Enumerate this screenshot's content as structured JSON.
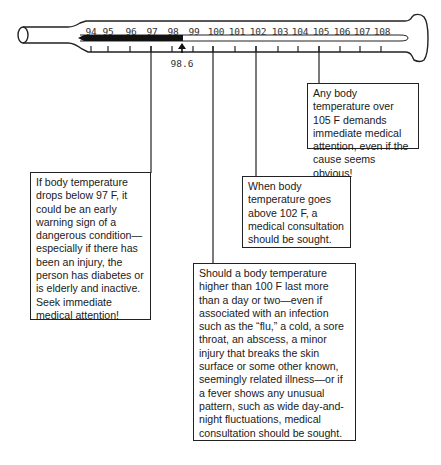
{
  "thermometer": {
    "unit": "F",
    "scale_labels": [
      "94",
      "95",
      "96",
      "97",
      "98",
      "99",
      "100",
      "101",
      "102",
      "103",
      "104",
      "105",
      "106",
      "107",
      "108"
    ],
    "normal_marker": {
      "value": 98.6,
      "label": "98.6"
    }
  },
  "notes": [
    {
      "id": "below-97",
      "threshold": "97",
      "text": "If body temperature drops below 97 F, it could be an early warning sign of a dangerous condition—especially if there has been an injury, the person has diabetes or is elderly and inactive. Seek immediate medical attention!"
    },
    {
      "id": "above-100",
      "threshold": "100",
      "text": "Should a body temperature higher than 100 F last more than a day or two—even if associated with an infection such as the “flu,” a cold, a sore throat, an abscess, a minor injury that breaks the skin surface or some other known, seemingly related illness—or if a fever shows any unusual pattern, such as wide day-and-night fluctuations, medical consultation should be sought."
    },
    {
      "id": "above-102",
      "threshold": "102",
      "text": "When body temperature goes above 102 F, a medical consultation should be sought."
    },
    {
      "id": "over-105",
      "threshold": "105",
      "text": "Any body temperature over 105 F demands immediate medical attention, even if the cause seems obvious!"
    }
  ]
}
